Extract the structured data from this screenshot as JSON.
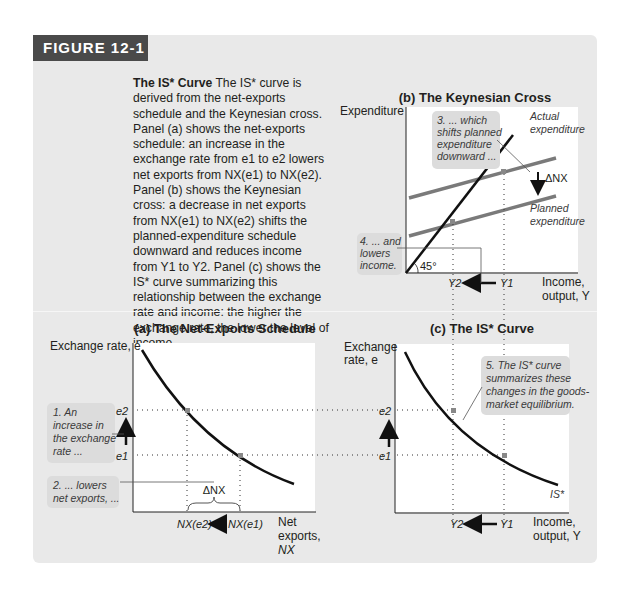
{
  "figure": {
    "label": "FIGURE 12-1",
    "caption_title": "The IS* Curve",
    "caption_body": "The IS* curve is derived from the net-exports schedule and the Keynesian cross. Panel (a) shows the net-exports schedule: an increase in the exchange rate from e1 to e2 lowers net exports from NX(e1) to NX(e2). Panel (b) shows the Keynesian cross: a decrease in net exports from NX(e1) to NX(e2) shifts the planned-expenditure schedule downward and reduces income from Y1 to Y2. Panel (c) shows the IS* curve summarizing this relationship between the exchange rate and income: the higher the exchange rate, the lower the level of income."
  },
  "panels": {
    "b": {
      "title": "(b) The Keynesian Cross",
      "ylabel": "Expenditure",
      "xlabel_1": "Income,",
      "xlabel_2": "output, Y",
      "actual_label_1": "Actual",
      "actual_label_2": "expenditure",
      "planned_label_1": "Planned",
      "planned_label_2": "expenditure",
      "delta_label": "ΔNX",
      "angle_label": "45°",
      "y1": "Y1",
      "y2": "Y2",
      "note3": [
        "3. ... which",
        "shifts planned",
        "expenditure",
        "downward ..."
      ],
      "note4": [
        "4. ... and",
        "lowers",
        "income."
      ]
    },
    "a": {
      "title": "(a) The Net-Exports Schedule",
      "ylabel": "Exchange rate, e",
      "xlabel": [
        "Net",
        "exports,",
        "NX"
      ],
      "e1": "e1",
      "e2": "e2",
      "nx1": "NX(e1)",
      "nx2": "NX(e2)",
      "delta_label": "ΔNX",
      "note1": [
        "1. An",
        "increase in",
        "the exchange",
        "rate ..."
      ],
      "note2": [
        "2. ... lowers",
        "net exports, ..."
      ]
    },
    "c": {
      "title": "(c) The IS* Curve",
      "ylabel": [
        "Exchange",
        "rate, e"
      ],
      "xlabel_1": "Income,",
      "xlabel_2": "output, Y",
      "curve_label": "IS*",
      "e1": "e1",
      "e2": "e2",
      "y1": "Y1",
      "y2": "Y2",
      "note5": [
        "5. The IS* curve",
        "summarizes these",
        "changes in the goods-",
        "market equilibrium."
      ]
    }
  },
  "colors": {
    "card": "#e9e9e9",
    "label_bg": "#4a4a4a",
    "plot_bg": "#ffffff",
    "curve": "#111111",
    "planned": "#7a7a7a",
    "note_bg": "#dcdcdc"
  }
}
